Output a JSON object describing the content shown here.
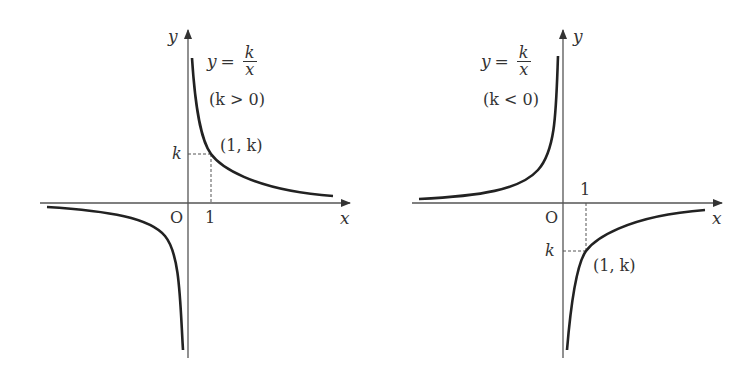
{
  "figure": {
    "panels": [
      {
        "id": "positive",
        "equation": {
          "lhs": "y",
          "op": "=",
          "num": "k",
          "den": "x"
        },
        "condition": "(k > 0)",
        "axis_labels": {
          "x": "x",
          "y": "y"
        },
        "origin_label": "O",
        "tick_x": "1",
        "tick_y": "k",
        "point_label": "(1, k)"
      },
      {
        "id": "negative",
        "equation": {
          "lhs": "y",
          "op": "=",
          "num": "k",
          "den": "x"
        },
        "condition": "(k < 0)",
        "axis_labels": {
          "x": "x",
          "y": "y"
        },
        "origin_label": "O",
        "tick_x": "1",
        "tick_y": "k",
        "point_label": "(1, k)"
      }
    ]
  },
  "colors": {
    "curve": "#222222",
    "axis": "#555555",
    "text": "#333333"
  }
}
